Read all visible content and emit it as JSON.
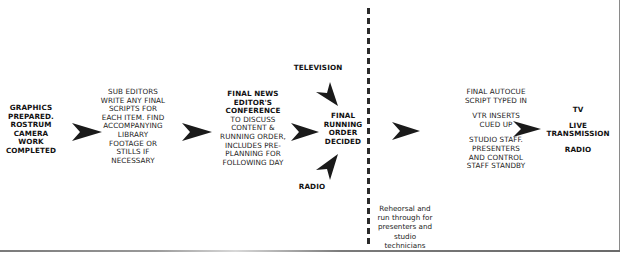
{
  "diagram": {
    "type": "flowchart",
    "nodes": {
      "graphics": {
        "lines": [
          "GRAPHICS",
          "PREPARED.",
          "ROSTRUM",
          "CAMERA",
          "WORK",
          "COMPLETED"
        ]
      },
      "sub_editors": {
        "lines": [
          "SUB EDITORS",
          "WRITE ANY FINAL",
          "SCRIPTS FOR",
          "EACH ITEM. FIND",
          "ACCOMPANYING",
          "LIBRARY",
          "FOOTAGE OR",
          "STILLS IF",
          "NECESSARY"
        ]
      },
      "conference": {
        "title_lines": [
          "FINAL NEWS",
          "EDITOR'S",
          "CONFERENCE"
        ],
        "body_lines": [
          "TO DISCUSS",
          "CONTENT &",
          "RUNNING ORDER,",
          "INCLUDES PRE-",
          "PLANNING FOR",
          "FOLLOWING DAY"
        ]
      },
      "television": {
        "label": "TELEVISION"
      },
      "radio_input": {
        "label": "RADIO"
      },
      "running_order": {
        "lines": [
          "FINAL",
          "RUNNING",
          "ORDER",
          "DECIDED"
        ]
      },
      "rehearsal": {
        "lines": [
          "Reheorsal and",
          "run through for",
          "presenters and",
          "studio",
          "technicians"
        ]
      },
      "autocue": {
        "groups": [
          [
            "FINAL AUTOCUE",
            "SCRIPT TYPED IN"
          ],
          [
            "VTR INSERTS",
            "CUED UP"
          ],
          [
            "STUDIO STAFF.",
            "PRESENTERS",
            "AND CONTROL",
            "STAFF STANDBY"
          ]
        ]
      },
      "transmission": {
        "tv": "TV",
        "live_lines": [
          "LIVE",
          "TRANSMISSION"
        ],
        "radio": "RADIO"
      }
    },
    "edges": [
      {
        "from": "graphics",
        "to": "sub_editors",
        "icon": "arrowhead-right-icon"
      },
      {
        "from": "sub_editors",
        "to": "conference",
        "icon": "arrowhead-right-icon"
      },
      {
        "from": "conference",
        "to": "running_order",
        "icon": "arrowhead-right-icon"
      },
      {
        "from": "television",
        "to": "running_order",
        "icon": "arrowhead-down-right-icon"
      },
      {
        "from": "radio_input",
        "to": "running_order",
        "icon": "arrowhead-up-right-icon"
      },
      {
        "from": "running_order",
        "to": "autocue",
        "icon": "arrowhead-right-icon"
      },
      {
        "from": "autocue",
        "to": "transmission",
        "icon": "arrowhead-right-icon"
      }
    ],
    "colors": {
      "text": "#111111",
      "arrow": "#1a1a1a",
      "divider": "#2a2a2a",
      "background": "#ffffff"
    }
  }
}
